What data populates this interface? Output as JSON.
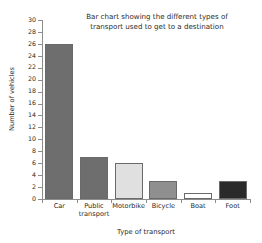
{
  "chart_data": {
    "type": "bar",
    "title": "Bar chart showing the different types of\ntransport used to get to a destination",
    "xlabel": "Type of transport",
    "ylabel": "Number of vehicles",
    "categories": [
      "Car",
      "Public\ntransport",
      "Motorbike",
      "Bicycle",
      "Boat",
      "Foot"
    ],
    "values": [
      26,
      7,
      6,
      3,
      1,
      3
    ],
    "ylim": [
      0,
      30
    ],
    "ytick_labels": [
      "0",
      "2",
      "4",
      "6",
      "8",
      "10",
      "12",
      "14",
      "16",
      "18",
      "20",
      "22",
      "24",
      "26",
      "28",
      "30"
    ],
    "ytick_values": [
      0,
      2,
      4,
      6,
      8,
      10,
      12,
      14,
      16,
      18,
      20,
      22,
      24,
      26,
      28,
      30
    ],
    "grid": false,
    "legend": "none",
    "bar_colors": [
      "#6e6e6e",
      "#6e6e6e",
      "#e0e0e0",
      "#8f8f8f",
      "#ffffff",
      "#2b2b2b"
    ],
    "bar_edge_color": "#6a6a6a",
    "axis_color": "#8d8d8d",
    "text_color": "#2a2a2a",
    "background": "#ffffff"
  }
}
